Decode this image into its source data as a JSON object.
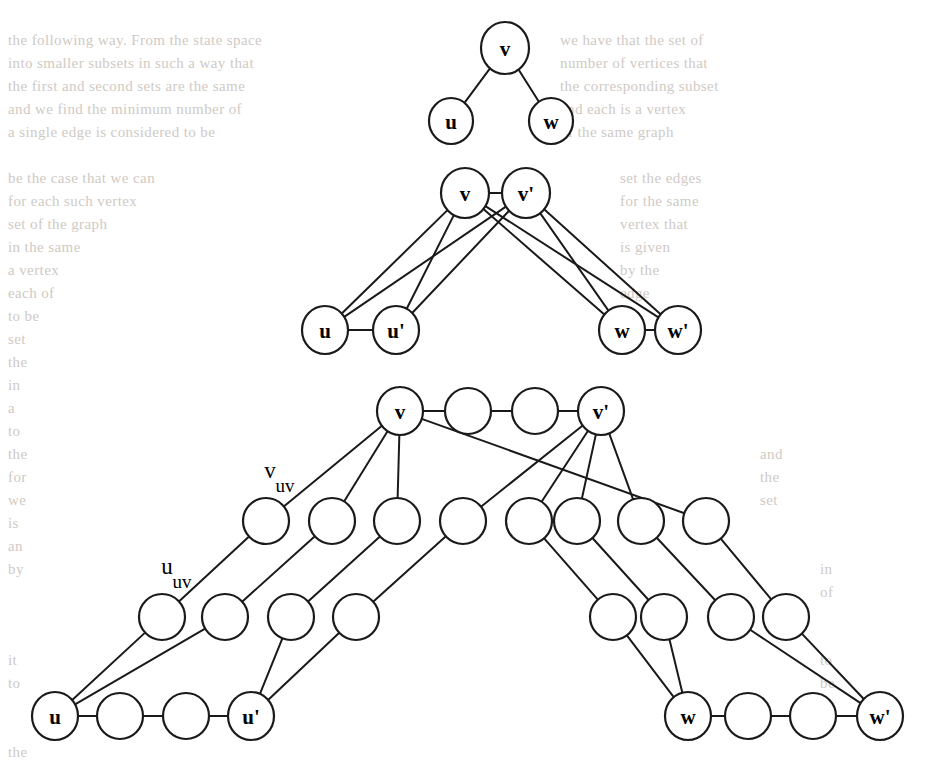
{
  "figure": {
    "stroke_color": "#1a1a1a",
    "node_fill": "#ffffff",
    "background_color": "#ffffff",
    "background_text_color": "#cfcac4"
  },
  "panels": [
    {
      "id": "panel-top",
      "name": "original-graph",
      "nodes": [
        {
          "id": "t_v",
          "label": "v",
          "x": 505,
          "y": 48,
          "rx": 24,
          "ry": 26
        },
        {
          "id": "t_u",
          "label": "u",
          "x": 451,
          "y": 121,
          "rx": 22,
          "ry": 23
        },
        {
          "id": "t_w",
          "label": "w",
          "x": 551,
          "y": 121,
          "rx": 22,
          "ry": 23
        }
      ],
      "edges": [
        {
          "from": "t_v",
          "to": "t_u"
        },
        {
          "from": "t_v",
          "to": "t_w"
        }
      ]
    },
    {
      "id": "panel-middle",
      "name": "doubled-vertex-gadget",
      "nodes": [
        {
          "id": "m_v",
          "label": "v",
          "x": 465,
          "y": 193,
          "rx": 24,
          "ry": 25
        },
        {
          "id": "m_vp",
          "label": "v'",
          "x": 526,
          "y": 193,
          "rx": 24,
          "ry": 25
        },
        {
          "id": "m_u",
          "label": "u",
          "x": 325,
          "y": 330,
          "rx": 23,
          "ry": 24
        },
        {
          "id": "m_up",
          "label": "u'",
          "x": 396,
          "y": 330,
          "rx": 23,
          "ry": 24
        },
        {
          "id": "m_w",
          "label": "w",
          "x": 622,
          "y": 330,
          "rx": 23,
          "ry": 24
        },
        {
          "id": "m_wp",
          "label": "w'",
          "x": 678,
          "y": 330,
          "rx": 23,
          "ry": 24
        }
      ],
      "edges": [
        {
          "from": "m_v",
          "to": "m_vp"
        },
        {
          "from": "m_u",
          "to": "m_up"
        },
        {
          "from": "m_w",
          "to": "m_wp"
        },
        {
          "from": "m_v",
          "to": "m_u"
        },
        {
          "from": "m_v",
          "to": "m_up"
        },
        {
          "from": "m_vp",
          "to": "m_u"
        },
        {
          "from": "m_vp",
          "to": "m_up"
        },
        {
          "from": "m_v",
          "to": "m_w"
        },
        {
          "from": "m_v",
          "to": "m_wp"
        },
        {
          "from": "m_vp",
          "to": "m_w"
        },
        {
          "from": "m_vp",
          "to": "m_wp"
        }
      ]
    },
    {
      "id": "panel-bottom",
      "name": "subdivided-gadget",
      "nodes": [
        {
          "id": "b_v",
          "label": "v",
          "x": 400,
          "y": 411,
          "rx": 23,
          "ry": 24
        },
        {
          "id": "b_vv1",
          "label": "",
          "x": 468,
          "y": 411,
          "rx": 23,
          "ry": 23
        },
        {
          "id": "b_vv2",
          "label": "",
          "x": 535,
          "y": 411,
          "rx": 23,
          "ry": 23
        },
        {
          "id": "b_vp",
          "label": "v'",
          "x": 601,
          "y": 411,
          "rx": 23,
          "ry": 24
        },
        {
          "id": "b_r2a",
          "label": "",
          "x": 266,
          "y": 521,
          "rx": 23,
          "ry": 23
        },
        {
          "id": "b_r2b",
          "label": "",
          "x": 332,
          "y": 521,
          "rx": 23,
          "ry": 23
        },
        {
          "id": "b_r2c",
          "label": "",
          "x": 397,
          "y": 521,
          "rx": 23,
          "ry": 23
        },
        {
          "id": "b_r2d",
          "label": "",
          "x": 463,
          "y": 521,
          "rx": 23,
          "ry": 23
        },
        {
          "id": "b_r2e",
          "label": "",
          "x": 529,
          "y": 521,
          "rx": 23,
          "ry": 23
        },
        {
          "id": "b_r2f",
          "label": "",
          "x": 577,
          "y": 521,
          "rx": 23,
          "ry": 23
        },
        {
          "id": "b_r2g",
          "label": "",
          "x": 641,
          "y": 521,
          "rx": 23,
          "ry": 23
        },
        {
          "id": "b_r2h",
          "label": "",
          "x": 706,
          "y": 521,
          "rx": 23,
          "ry": 23
        },
        {
          "id": "b_r3a",
          "label": "",
          "x": 162,
          "y": 617,
          "rx": 23,
          "ry": 23
        },
        {
          "id": "b_r3b",
          "label": "",
          "x": 225,
          "y": 617,
          "rx": 23,
          "ry": 23
        },
        {
          "id": "b_r3c",
          "label": "",
          "x": 291,
          "y": 617,
          "rx": 23,
          "ry": 23
        },
        {
          "id": "b_r3d",
          "label": "",
          "x": 356,
          "y": 617,
          "rx": 23,
          "ry": 23
        },
        {
          "id": "b_r3e",
          "label": "",
          "x": 613,
          "y": 617,
          "rx": 23,
          "ry": 23
        },
        {
          "id": "b_r3f",
          "label": "",
          "x": 664,
          "y": 617,
          "rx": 23,
          "ry": 23
        },
        {
          "id": "b_r3g",
          "label": "",
          "x": 731,
          "y": 617,
          "rx": 23,
          "ry": 23
        },
        {
          "id": "b_r3h",
          "label": "",
          "x": 786,
          "y": 617,
          "rx": 23,
          "ry": 23
        },
        {
          "id": "b_u",
          "label": "u",
          "x": 55,
          "y": 716,
          "rx": 23,
          "ry": 24
        },
        {
          "id": "b_uu1",
          "label": "",
          "x": 120,
          "y": 716,
          "rx": 23,
          "ry": 23
        },
        {
          "id": "b_uu2",
          "label": "",
          "x": 186,
          "y": 716,
          "rx": 23,
          "ry": 23
        },
        {
          "id": "b_up",
          "label": "u'",
          "x": 251,
          "y": 716,
          "rx": 23,
          "ry": 24
        },
        {
          "id": "b_w",
          "label": "w",
          "x": 688,
          "y": 716,
          "rx": 23,
          "ry": 24
        },
        {
          "id": "b_ww1",
          "label": "",
          "x": 748,
          "y": 716,
          "rx": 23,
          "ry": 23
        },
        {
          "id": "b_ww2",
          "label": "",
          "x": 813,
          "y": 716,
          "rx": 23,
          "ry": 23
        },
        {
          "id": "b_wp",
          "label": "w'",
          "x": 880,
          "y": 716,
          "rx": 23,
          "ry": 24
        }
      ],
      "edges": [
        {
          "from": "b_v",
          "to": "b_vv1"
        },
        {
          "from": "b_vv1",
          "to": "b_vv2"
        },
        {
          "from": "b_vv2",
          "to": "b_vp"
        },
        {
          "from": "b_u",
          "to": "b_uu1"
        },
        {
          "from": "b_uu1",
          "to": "b_uu2"
        },
        {
          "from": "b_uu2",
          "to": "b_up"
        },
        {
          "from": "b_w",
          "to": "b_ww1"
        },
        {
          "from": "b_ww1",
          "to": "b_ww2"
        },
        {
          "from": "b_ww2",
          "to": "b_wp"
        },
        {
          "from": "b_v",
          "to": "b_r2a"
        },
        {
          "from": "b_r2a",
          "to": "b_r3a"
        },
        {
          "from": "b_r3a",
          "to": "b_u"
        },
        {
          "from": "b_v",
          "to": "b_r2b"
        },
        {
          "from": "b_r2b",
          "to": "b_r3b"
        },
        {
          "from": "b_r3b",
          "to": "b_u"
        },
        {
          "from": "b_v",
          "to": "b_r2c"
        },
        {
          "from": "b_r2c",
          "to": "b_r3c"
        },
        {
          "from": "b_r3c",
          "to": "b_up"
        },
        {
          "from": "b_vp",
          "to": "b_r2d"
        },
        {
          "from": "b_r2d",
          "to": "b_r3d"
        },
        {
          "from": "b_r3d",
          "to": "b_up"
        },
        {
          "from": "b_vp",
          "to": "b_r2e"
        },
        {
          "from": "b_r2e",
          "to": "b_r3e"
        },
        {
          "from": "b_r3e",
          "to": "b_w"
        },
        {
          "from": "b_vp",
          "to": "b_r2f"
        },
        {
          "from": "b_r2f",
          "to": "b_r3f"
        },
        {
          "from": "b_r3f",
          "to": "b_w"
        },
        {
          "from": "b_vp",
          "to": "b_r2g"
        },
        {
          "from": "b_r2g",
          "to": "b_r3g"
        },
        {
          "from": "b_r3g",
          "to": "b_wp"
        },
        {
          "from": "b_v",
          "to": "b_r2h"
        },
        {
          "from": "b_r2h",
          "to": "b_r3h"
        },
        {
          "from": "b_r3h",
          "to": "b_wp"
        }
      ],
      "external_labels": [
        {
          "id": "lbl-v-uv",
          "base": "v",
          "sub": "uv",
          "x": 270,
          "y": 478
        },
        {
          "id": "lbl-u-uv",
          "base": "u",
          "sub": "uv",
          "x": 167,
          "y": 574
        }
      ]
    }
  ],
  "background_text": {
    "note": "Faint show-through text from the reverse side of the printed page",
    "lines": [
      {
        "x": 8,
        "y": 45,
        "text": "the following way. From the state space"
      },
      {
        "x": 8,
        "y": 68,
        "text": "into smaller subsets in such a way that"
      },
      {
        "x": 8,
        "y": 91,
        "text": "the first and second sets are the same"
      },
      {
        "x": 8,
        "y": 114,
        "text": "and we find the minimum number of"
      },
      {
        "x": 8,
        "y": 137,
        "text": "a single edge is considered to be"
      },
      {
        "x": 8,
        "y": 183,
        "text": "be the case that we can"
      },
      {
        "x": 8,
        "y": 206,
        "text": "for each such vertex"
      },
      {
        "x": 8,
        "y": 229,
        "text": "set of the graph"
      },
      {
        "x": 8,
        "y": 252,
        "text": "in the same"
      },
      {
        "x": 8,
        "y": 275,
        "text": "a vertex"
      },
      {
        "x": 8,
        "y": 298,
        "text": "each of"
      },
      {
        "x": 8,
        "y": 321,
        "text": "to be"
      },
      {
        "x": 8,
        "y": 344,
        "text": "set"
      },
      {
        "x": 8,
        "y": 367,
        "text": "the"
      },
      {
        "x": 8,
        "y": 390,
        "text": "in"
      },
      {
        "x": 8,
        "y": 413,
        "text": "a"
      },
      {
        "x": 8,
        "y": 436,
        "text": "to"
      },
      {
        "x": 8,
        "y": 459,
        "text": "the"
      },
      {
        "x": 8,
        "y": 482,
        "text": "for"
      },
      {
        "x": 8,
        "y": 505,
        "text": "we"
      },
      {
        "x": 8,
        "y": 528,
        "text": "is"
      },
      {
        "x": 8,
        "y": 551,
        "text": "an"
      },
      {
        "x": 8,
        "y": 574,
        "text": "by"
      },
      {
        "x": 8,
        "y": 665,
        "text": "it"
      },
      {
        "x": 8,
        "y": 688,
        "text": "to"
      },
      {
        "x": 8,
        "y": 757,
        "text": "the"
      },
      {
        "x": 560,
        "y": 45,
        "text": "we have that the set of"
      },
      {
        "x": 560,
        "y": 68,
        "text": "number of vertices that"
      },
      {
        "x": 560,
        "y": 91,
        "text": "the corresponding subset"
      },
      {
        "x": 560,
        "y": 114,
        "text": "and each is a vertex"
      },
      {
        "x": 560,
        "y": 137,
        "text": "of the same graph"
      },
      {
        "x": 620,
        "y": 183,
        "text": "set the edges"
      },
      {
        "x": 620,
        "y": 206,
        "text": "for the same"
      },
      {
        "x": 620,
        "y": 229,
        "text": "vertex that"
      },
      {
        "x": 620,
        "y": 252,
        "text": "is given"
      },
      {
        "x": 620,
        "y": 275,
        "text": "by the"
      },
      {
        "x": 620,
        "y": 298,
        "text": "edge"
      },
      {
        "x": 620,
        "y": 321,
        "text": "set"
      },
      {
        "x": 620,
        "y": 344,
        "text": "of"
      },
      {
        "x": 760,
        "y": 459,
        "text": "and"
      },
      {
        "x": 760,
        "y": 482,
        "text": "the"
      },
      {
        "x": 760,
        "y": 505,
        "text": "set"
      },
      {
        "x": 820,
        "y": 574,
        "text": "in"
      },
      {
        "x": 820,
        "y": 597,
        "text": "of"
      },
      {
        "x": 820,
        "y": 665,
        "text": "to"
      },
      {
        "x": 820,
        "y": 688,
        "text": "be"
      }
    ]
  }
}
